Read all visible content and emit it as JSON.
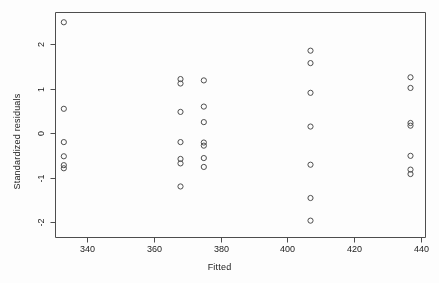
{
  "chart_data": {
    "type": "scatter",
    "title": "",
    "xlabel": "Fitted",
    "ylabel": "Standardized residuals",
    "xlim": [
      330.5,
      441.5
    ],
    "ylim": [
      -2.35,
      2.72
    ],
    "xticks": [
      340,
      360,
      380,
      400,
      420,
      440
    ],
    "yticks": [
      2,
      1,
      0,
      -1,
      -2
    ],
    "grid": false,
    "legend": null,
    "marker": "open-circle",
    "marker_color": "#4d4d4d",
    "points": [
      {
        "x": 333,
        "y": 2.5
      },
      {
        "x": 333,
        "y": 0.55
      },
      {
        "x": 333,
        "y": -0.2
      },
      {
        "x": 333,
        "y": -0.52
      },
      {
        "x": 333,
        "y": -0.72
      },
      {
        "x": 333,
        "y": -0.79
      },
      {
        "x": 368,
        "y": 1.22
      },
      {
        "x": 368,
        "y": 1.12
      },
      {
        "x": 368,
        "y": 0.48
      },
      {
        "x": 368,
        "y": -0.2
      },
      {
        "x": 368,
        "y": -0.58
      },
      {
        "x": 368,
        "y": -0.68
      },
      {
        "x": 368,
        "y": -1.2
      },
      {
        "x": 375,
        "y": 1.19
      },
      {
        "x": 375,
        "y": 0.6
      },
      {
        "x": 375,
        "y": 0.25
      },
      {
        "x": 375,
        "y": -0.21
      },
      {
        "x": 375,
        "y": -0.28
      },
      {
        "x": 375,
        "y": -0.56
      },
      {
        "x": 375,
        "y": -0.76
      },
      {
        "x": 407,
        "y": 1.86
      },
      {
        "x": 407,
        "y": 1.58
      },
      {
        "x": 407,
        "y": 0.91
      },
      {
        "x": 407,
        "y": 0.15
      },
      {
        "x": 407,
        "y": -0.71
      },
      {
        "x": 407,
        "y": -1.46
      },
      {
        "x": 407,
        "y": -1.97
      },
      {
        "x": 437,
        "y": 1.26
      },
      {
        "x": 437,
        "y": 1.02
      },
      {
        "x": 437,
        "y": 0.23
      },
      {
        "x": 437,
        "y": 0.17
      },
      {
        "x": 437,
        "y": -0.51
      },
      {
        "x": 437,
        "y": -0.82
      },
      {
        "x": 437,
        "y": -0.92
      }
    ]
  }
}
